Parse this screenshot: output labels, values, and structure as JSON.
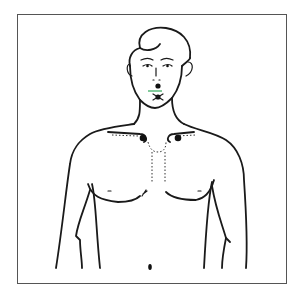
{
  "figure": {
    "style": "black line art in rectangular frame",
    "colors": {
      "line": "#1a1a1a",
      "frame": "#555555",
      "background": "#ffffff",
      "marker": "#111111",
      "accent_line": "#2fa85a"
    },
    "markers": [
      {
        "name": "upper-lip-point",
        "x": 153,
        "y": 87
      },
      {
        "name": "chin-point",
        "x": 153,
        "y": 97
      },
      {
        "name": "left-clavicle-point",
        "x": 143,
        "y": 138
      },
      {
        "name": "right-clavicle-point",
        "x": 178,
        "y": 138
      }
    ]
  }
}
